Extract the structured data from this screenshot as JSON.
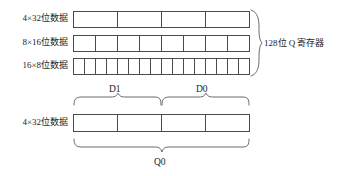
{
  "figure": {
    "top_group": {
      "rows": [
        {
          "label": "4×32位数据",
          "cells": 4
        },
        {
          "label": "8×16位数据",
          "cells": 8
        },
        {
          "label": "16×8位数据",
          "cells": 16
        }
      ],
      "brace_label": "128位 Q 寄存器"
    },
    "bottom_group": {
      "row": {
        "label": "4×32位数据",
        "cells": 4
      },
      "top_braces": [
        {
          "label": "D1"
        },
        {
          "label": "D0"
        }
      ],
      "bottom_brace": {
        "label": "Q0"
      }
    }
  },
  "colors": {
    "background": "#ffffff",
    "line": "#4a4a4a",
    "text": "#1c1c1c",
    "brace": "#6b6b6b"
  }
}
